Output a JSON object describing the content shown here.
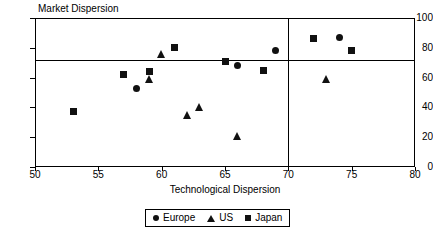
{
  "chart_data": {
    "type": "scatter",
    "title": "Market Dispersion",
    "xlabel": "Technological Dispersion",
    "ylabel": "Market Dispersion",
    "xlim": [
      50,
      80
    ],
    "ylim": [
      0,
      100
    ],
    "xticks": [
      50,
      55,
      60,
      65,
      70,
      75,
      80
    ],
    "yticks": [
      0,
      20,
      40,
      60,
      80,
      100
    ],
    "grid": false,
    "legend_position": "bottom",
    "reference_lines": {
      "horizontal": 72,
      "vertical": 70
    },
    "series": [
      {
        "name": "Europe",
        "marker": "circle",
        "color": "#111111",
        "points": [
          {
            "x": 58,
            "y": 53
          },
          {
            "x": 66,
            "y": 68
          },
          {
            "x": 69,
            "y": 78
          },
          {
            "x": 74,
            "y": 87
          }
        ]
      },
      {
        "name": "US",
        "marker": "triangle",
        "color": "#111111",
        "points": [
          {
            "x": 59,
            "y": 59
          },
          {
            "x": 60,
            "y": 76
          },
          {
            "x": 62,
            "y": 35
          },
          {
            "x": 63,
            "y": 40
          },
          {
            "x": 66,
            "y": 21
          },
          {
            "x": 73,
            "y": 59
          }
        ]
      },
      {
        "name": "Japan",
        "marker": "square",
        "color": "#111111",
        "points": [
          {
            "x": 53,
            "y": 37
          },
          {
            "x": 57,
            "y": 62
          },
          {
            "x": 59,
            "y": 64
          },
          {
            "x": 61,
            "y": 80
          },
          {
            "x": 65,
            "y": 71
          },
          {
            "x": 68,
            "y": 65
          },
          {
            "x": 72,
            "y": 86
          },
          {
            "x": 75,
            "y": 78
          }
        ]
      }
    ]
  },
  "legend": {
    "items": [
      {
        "label": "Europe",
        "marker": "circle"
      },
      {
        "label": "US",
        "marker": "triangle"
      },
      {
        "label": "Japan",
        "marker": "square"
      }
    ]
  }
}
